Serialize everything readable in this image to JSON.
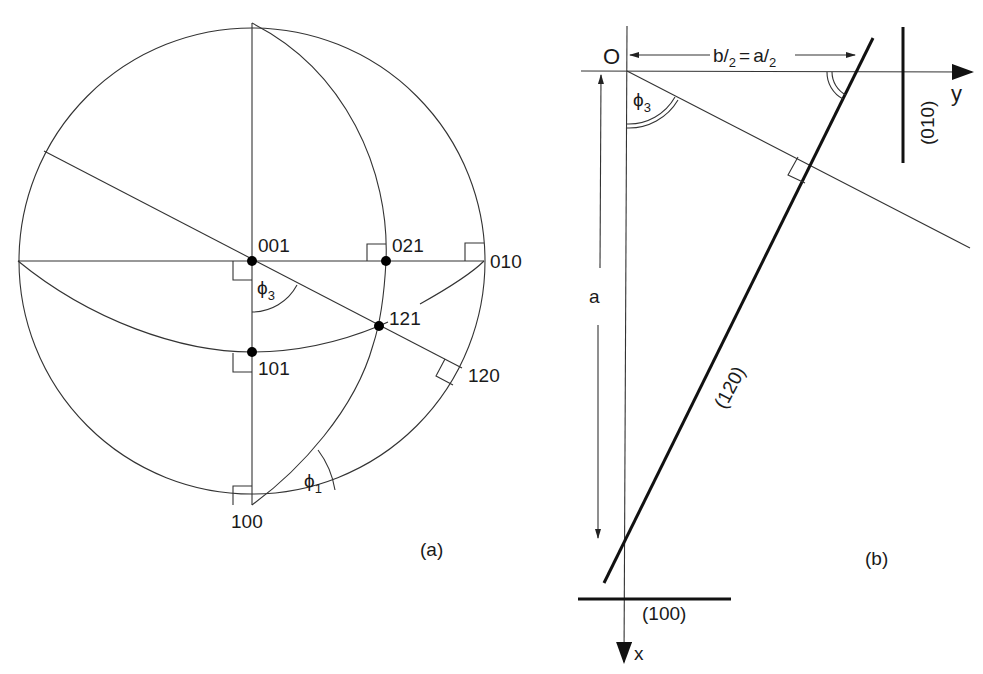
{
  "panel_a": {
    "caption": "(a)",
    "poles": {
      "p001": "001",
      "p021": "021",
      "p010": "010",
      "p121": "121",
      "p101": "101",
      "p120": "120",
      "p100": "100"
    },
    "angles": {
      "phi3": "ϕ",
      "phi3_sub": "3",
      "phi1": "ϕ",
      "phi1_sub": "1"
    }
  },
  "panel_b": {
    "caption": "(b)",
    "origin": "O",
    "axis_y": "y",
    "axis_x": "x",
    "dimension_top": "b/2 = a/2",
    "dimension_top_parts": {
      "b": "b",
      "slash": "/",
      "two": "2",
      "eq": "=",
      "a": "a"
    },
    "dimension_left": "a",
    "plane_120": "(120)",
    "plane_010": "(010)",
    "plane_100": "(100)",
    "angle_phi3": "ϕ",
    "angle_phi3_sub": "3"
  }
}
